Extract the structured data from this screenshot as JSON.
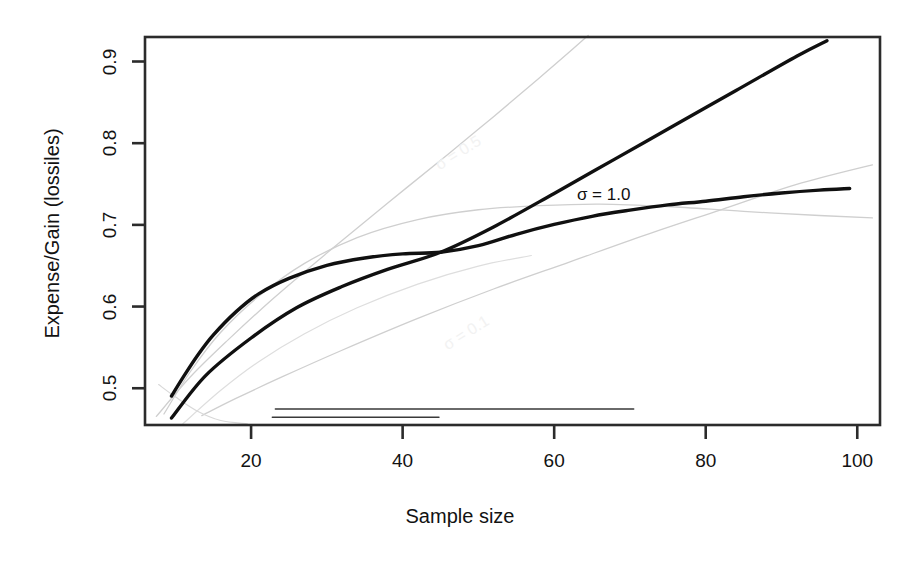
{
  "chart_data": {
    "type": "line",
    "title": "",
    "xlabel": "Sample size",
    "ylabel": "Expense/Gain (lossiles)",
    "xlim": [
      6,
      103
    ],
    "ylim": [
      0.455,
      0.93
    ],
    "xticks": [
      20,
      40,
      60,
      80,
      100
    ],
    "yticks": [
      0.5,
      0.6,
      0.7,
      0.8,
      0.9
    ],
    "xtick_labels": [
      "20",
      "40",
      "60",
      "80",
      "100"
    ],
    "ytick_labels": [
      "0.5",
      "0.6",
      "0.7",
      "0.8",
      "0.9"
    ],
    "grid": false,
    "legend_position": "none",
    "annotations": [
      {
        "text": "σ = 1.0",
        "x": 63,
        "y": 0.735,
        "style": "dark"
      },
      {
        "text": "σ = 0.5",
        "x": 44,
        "y": 0.785,
        "style": "ghost"
      },
      {
        "text": "σ = 0.1",
        "x": 45,
        "y": 0.565,
        "style": "ghost"
      }
    ],
    "series": [
      {
        "name": "concave-bold",
        "style": "bold-black",
        "color": "#101010",
        "width": 3.4,
        "points": [
          [
            9.5,
            0.4905
          ],
          [
            11,
            0.513
          ],
          [
            13,
            0.541
          ],
          [
            15,
            0.565
          ],
          [
            18,
            0.5935
          ],
          [
            21,
            0.6155
          ],
          [
            25,
            0.6345
          ],
          [
            30,
            0.6505
          ],
          [
            35,
            0.6595
          ],
          [
            40,
            0.6645
          ],
          [
            45,
            0.6665
          ],
          [
            50,
            0.6745
          ],
          [
            55,
            0.6885
          ],
          [
            60,
            0.7005
          ],
          [
            65,
            0.7105
          ],
          [
            70,
            0.718
          ],
          [
            75,
            0.7245
          ],
          [
            80,
            0.729
          ],
          [
            85,
            0.7345
          ],
          [
            90,
            0.739
          ],
          [
            95,
            0.7425
          ],
          [
            99,
            0.7445
          ]
        ]
      },
      {
        "name": "steep-bold",
        "style": "bold-black",
        "color": "#101010",
        "width": 3.4,
        "points": [
          [
            9.5,
            0.4635
          ],
          [
            14,
            0.5155
          ],
          [
            20,
            0.5615
          ],
          [
            26,
            0.5985
          ],
          [
            32,
            0.6245
          ],
          [
            38,
            0.6455
          ],
          [
            45,
            0.6665
          ],
          [
            52,
            0.6975
          ],
          [
            60,
            0.7385
          ],
          [
            68,
            0.7805
          ],
          [
            76,
            0.8225
          ],
          [
            84,
            0.8645
          ],
          [
            92,
            0.9065
          ],
          [
            96,
            0.9255
          ]
        ]
      },
      {
        "name": "gray-steep-1",
        "style": "thin-gray",
        "color": "#cfcfcf",
        "width": 1.3,
        "points": [
          [
            7.5,
            0.4655
          ],
          [
            12,
            0.514
          ],
          [
            17,
            0.5595
          ],
          [
            23,
            0.6105
          ],
          [
            30,
            0.6655
          ],
          [
            38,
            0.7265
          ],
          [
            46,
            0.7865
          ],
          [
            52,
            0.8325
          ],
          [
            58,
            0.8795
          ],
          [
            62,
            0.9115
          ],
          [
            64.5,
            0.932
          ]
        ]
      },
      {
        "name": "gray-concave-1",
        "style": "thin-gray",
        "color": "#cfcfcf",
        "width": 1.3,
        "points": [
          [
            8.5,
            0.4685
          ],
          [
            12,
            0.5205
          ],
          [
            16,
            0.5685
          ],
          [
            21,
            0.6125
          ],
          [
            27,
            0.6525
          ],
          [
            34,
            0.6845
          ],
          [
            42,
            0.7065
          ],
          [
            50,
            0.7185
          ],
          [
            58,
            0.7235
          ],
          [
            66,
            0.7255
          ],
          [
            75,
            0.7225
          ],
          [
            85,
            0.7165
          ],
          [
            95,
            0.7115
          ],
          [
            102,
            0.7085
          ]
        ]
      },
      {
        "name": "gray-rising-2",
        "style": "thin-gray",
        "color": "#cfcfcf",
        "width": 1.3,
        "points": [
          [
            13.5,
            0.4665
          ],
          [
            18,
            0.4875
          ],
          [
            24,
            0.5135
          ],
          [
            32,
            0.5465
          ],
          [
            42,
            0.5855
          ],
          [
            52,
            0.6215
          ],
          [
            62,
            0.6545
          ],
          [
            72,
            0.6875
          ],
          [
            82,
            0.7185
          ],
          [
            92,
            0.7495
          ],
          [
            102,
            0.7735
          ]
        ]
      },
      {
        "name": "gray-low-fan",
        "style": "thin-gray",
        "color": "#dedede",
        "width": 1.2,
        "points": [
          [
            11,
            0.4565
          ],
          [
            16,
            0.4975
          ],
          [
            21,
            0.5325
          ],
          [
            27,
            0.5665
          ],
          [
            34,
            0.5985
          ],
          [
            42,
            0.6275
          ],
          [
            50,
            0.6495
          ],
          [
            57,
            0.6625
          ]
        ]
      },
      {
        "name": "gray-short-left",
        "style": "thin-gray",
        "color": "#d8d8d8",
        "width": 1.2,
        "points": [
          [
            7.8,
            0.5045
          ],
          [
            10,
            0.4895
          ],
          [
            13,
            0.4715
          ],
          [
            16,
            0.4605
          ],
          [
            19.5,
            0.4565
          ]
        ]
      },
      {
        "name": "baseline-rule-1",
        "style": "thin-dark-rule",
        "color": "#3a3a3a",
        "width": 1.4,
        "points": [
          [
            23.2,
            0.4745
          ],
          [
            70.5,
            0.4745
          ]
        ]
      },
      {
        "name": "baseline-rule-2",
        "style": "thin-dark-rule",
        "color": "#3a3a3a",
        "width": 1.4,
        "points": [
          [
            22.8,
            0.4645
          ],
          [
            44.8,
            0.4645
          ]
        ]
      },
      {
        "name": "baseline-rule-3",
        "style": "thin-dark-rule",
        "color": "#3a3a3a",
        "width": 1.4,
        "points": [
          [
            18.0,
            0.4555
          ],
          [
            28.5,
            0.4555
          ]
        ]
      }
    ]
  },
  "figure": {
    "frame_color": "#2b2b2b",
    "background": "#ffffff"
  }
}
